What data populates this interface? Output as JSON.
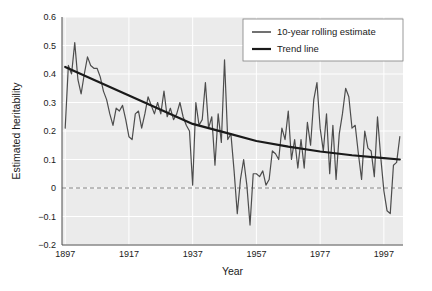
{
  "chart_data": {
    "type": "line",
    "title": "",
    "xlabel": "Year",
    "ylabel": "Estimated heritability",
    "xlim": [
      1896,
      2003
    ],
    "ylim": [
      -0.2,
      0.6
    ],
    "xticks": [
      1897,
      1917,
      1937,
      1957,
      1977,
      1997
    ],
    "yticks": [
      -0.2,
      -0.1,
      0,
      0.1,
      0.2,
      0.3,
      0.4,
      0.5,
      0.6
    ],
    "xtick_labels": [
      "1897",
      "1917",
      "1937",
      "1957",
      "1977",
      "1997"
    ],
    "ytick_labels": [
      "-0.2",
      "-0.1",
      "0",
      "0.1",
      "0.2",
      "0.3",
      "0.4",
      "0.5",
      "0.6"
    ],
    "grid": true,
    "grid_color": "#ffffff",
    "plot_bg": "#ebebeb",
    "zero_line": {
      "value": 0,
      "style": "dashed",
      "color": "#808080"
    },
    "legend": {
      "position": "top-right",
      "entries": [
        {
          "label": "10-year rolling estimate",
          "color": "#4d4d4d",
          "width": 1.2
        },
        {
          "label": "Trend line",
          "color": "#1a1a1a",
          "width": 2.2
        }
      ]
    },
    "series": [
      {
        "name": "10-year rolling estimate",
        "color": "#4d4d4d",
        "x": [
          1897,
          1898,
          1899,
          1900,
          1901,
          1902,
          1903,
          1904,
          1905,
          1906,
          1907,
          1908,
          1909,
          1910,
          1911,
          1912,
          1913,
          1914,
          1915,
          1916,
          1917,
          1918,
          1919,
          1920,
          1921,
          1922,
          1923,
          1924,
          1925,
          1926,
          1927,
          1928,
          1929,
          1930,
          1931,
          1932,
          1933,
          1934,
          1935,
          1936,
          1937,
          1938,
          1939,
          1940,
          1941,
          1942,
          1943,
          1944,
          1945,
          1946,
          1947,
          1948,
          1949,
          1950,
          1951,
          1952,
          1953,
          1954,
          1955,
          1956,
          1957,
          1958,
          1959,
          1960,
          1961,
          1962,
          1963,
          1964,
          1965,
          1966,
          1967,
          1968,
          1969,
          1970,
          1971,
          1972,
          1973,
          1974,
          1975,
          1976,
          1977,
          1978,
          1979,
          1980,
          1981,
          1982,
          1983,
          1984,
          1985,
          1986,
          1987,
          1988,
          1989,
          1990,
          1991,
          1992,
          1993,
          1994,
          1995,
          1996,
          1997,
          1998,
          1999,
          2000,
          2001,
          2002
        ],
        "y": [
          0.21,
          0.43,
          0.4,
          0.51,
          0.38,
          0.33,
          0.4,
          0.46,
          0.43,
          0.42,
          0.42,
          0.39,
          0.34,
          0.31,
          0.26,
          0.22,
          0.28,
          0.27,
          0.29,
          0.24,
          0.18,
          0.17,
          0.26,
          0.27,
          0.21,
          0.26,
          0.32,
          0.29,
          0.26,
          0.3,
          0.26,
          0.34,
          0.25,
          0.28,
          0.24,
          0.26,
          0.3,
          0.25,
          0.22,
          0.2,
          0.01,
          0.3,
          0.22,
          0.24,
          0.37,
          0.21,
          0.25,
          0.08,
          0.26,
          0.16,
          0.45,
          0.17,
          0.19,
          0.06,
          -0.09,
          0.03,
          0.1,
          0.01,
          -0.13,
          0.05,
          0.05,
          0.04,
          0.06,
          0.01,
          0.03,
          0.13,
          0.12,
          0.1,
          0.21,
          0.17,
          0.27,
          0.1,
          0.17,
          0.07,
          0.17,
          0.07,
          0.23,
          0.15,
          0.31,
          0.37,
          0.21,
          0.13,
          0.26,
          0.05,
          0.22,
          0.03,
          0.19,
          0.26,
          0.35,
          0.32,
          0.21,
          0.22,
          0.12,
          0.03,
          0.2,
          0.14,
          0.13,
          0.04,
          0.25,
          0.11,
          -0.01,
          -0.08,
          -0.09,
          0.08,
          0.09,
          0.18
        ]
      },
      {
        "name": "Trend line",
        "color": "#1a1a1a",
        "x": [
          1897,
          1907,
          1917,
          1927,
          1937,
          1947,
          1957,
          1967,
          1977,
          1987,
          1997,
          2002
        ],
        "y": [
          0.425,
          0.375,
          0.325,
          0.275,
          0.225,
          0.195,
          0.165,
          0.145,
          0.128,
          0.115,
          0.105,
          0.1
        ]
      }
    ]
  }
}
